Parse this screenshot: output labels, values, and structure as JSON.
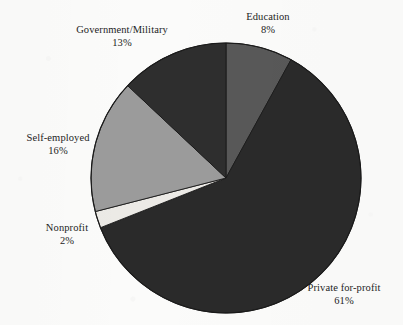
{
  "chart_data": {
    "type": "pie",
    "title": "",
    "subtitle": "",
    "xlabel": "",
    "ylabel": "",
    "legend_position": "none",
    "grid": false,
    "value_unit": "%",
    "start_angle_deg": 0,
    "direction": "clockwise",
    "categories": [
      "Education",
      "Private for-profit",
      "Nonprofit",
      "Self-employed",
      "Government/Military"
    ],
    "values": [
      8,
      61,
      2,
      16,
      13
    ],
    "slices": [
      {
        "label": "Education",
        "value": 8,
        "value_text": "8%",
        "color": "#585858",
        "start_deg": 0,
        "end_deg": 28.8,
        "label_position": "top-right"
      },
      {
        "label": "Private for-profit",
        "value": 61,
        "value_text": "61%",
        "color": "#2a2a2a",
        "start_deg": 28.8,
        "end_deg": 248.4,
        "label_position": "bottom-right"
      },
      {
        "label": "Nonprofit",
        "value": 2,
        "value_text": "2%",
        "color": "#eceae6",
        "start_deg": 248.4,
        "end_deg": 255.6,
        "label_position": "left-lower"
      },
      {
        "label": "Self-employed",
        "value": 16,
        "value_text": "16%",
        "color": "#9b9b9b",
        "start_deg": 255.6,
        "end_deg": 313.2,
        "label_position": "left"
      },
      {
        "label": "Government/Military",
        "value": 13,
        "value_text": "13%",
        "color": "#2e2e2e",
        "start_deg": 313.2,
        "end_deg": 360,
        "label_position": "top-left"
      }
    ],
    "total": 100
  },
  "labels": {
    "government_military": {
      "name": "Government/Military",
      "value": "13%"
    },
    "education": {
      "name": "Education",
      "value": "8%"
    },
    "self_employed": {
      "name": "Self-employed",
      "value": "16%"
    },
    "nonprofit": {
      "name": "Nonprofit",
      "value": "2%"
    },
    "private_for_profit": {
      "name": "Private for-profit",
      "value": "61%"
    }
  },
  "colors": {
    "education": "#585858",
    "private_for_profit": "#2a2a2a",
    "nonprofit": "#eceae6",
    "self_employed": "#9b9b9b",
    "government_military": "#2e2e2e",
    "outline": "#1a1a1a",
    "background": "#fbfbfa",
    "text": "#1d1d1d"
  },
  "geometry": {
    "center_x": 226,
    "center_y": 178,
    "radius": 135
  }
}
